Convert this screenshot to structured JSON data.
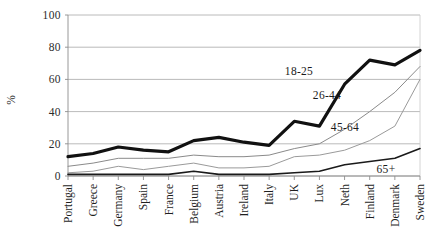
{
  "chart_data": {
    "type": "line",
    "title": "",
    "xlabel": "",
    "ylabel": "%",
    "ylim": [
      0,
      100
    ],
    "yticks": [
      0,
      20,
      40,
      60,
      80,
      100
    ],
    "grid": true,
    "legend_position": "inline-annotations",
    "categories": [
      "Portugal",
      "Greece",
      "Germany",
      "Spain",
      "France",
      "Belgium",
      "Austria",
      "Ireland",
      "Italy",
      "UK",
      "Lux",
      "Neth",
      "Finland",
      "Denmark",
      "Sweden"
    ],
    "series": [
      {
        "name": "18-25",
        "label": "18-25",
        "style": "thick-black",
        "color": "#111111",
        "width": 3.2,
        "values": [
          12,
          14,
          18,
          16,
          15,
          22,
          24,
          21,
          19,
          34,
          31,
          57,
          72,
          69,
          78
        ]
      },
      {
        "name": "26-44",
        "label": "26-44",
        "style": "thin-gray",
        "color": "#8a8a8a",
        "width": 1.0,
        "values": [
          6,
          8,
          11,
          11,
          11,
          13,
          12,
          12,
          13,
          17,
          20,
          29,
          40,
          52,
          68
        ]
      },
      {
        "name": "45-64",
        "label": "45-64",
        "style": "thin-gray",
        "color": "#9a9a9a",
        "width": 1.0,
        "values": [
          2,
          3,
          6,
          4,
          6,
          8,
          5,
          5,
          6,
          12,
          13,
          16,
          22,
          31,
          60
        ]
      },
      {
        "name": "65+",
        "label": "65+",
        "style": "medium-black",
        "color": "#1a1a1a",
        "width": 1.6,
        "values": [
          1,
          1,
          1,
          1,
          1,
          3,
          1,
          1,
          1,
          2,
          3,
          7,
          9,
          11,
          17
        ]
      }
    ],
    "series_annotations": [
      {
        "label": "18-25",
        "x_px": 299,
        "y_px": 75
      },
      {
        "label": "26-44",
        "x_px": 327,
        "y_px": 99
      },
      {
        "label": "45-64",
        "x_px": 345,
        "y_px": 131
      },
      {
        "label": "65+",
        "x_px": 386,
        "y_px": 173
      }
    ]
  }
}
